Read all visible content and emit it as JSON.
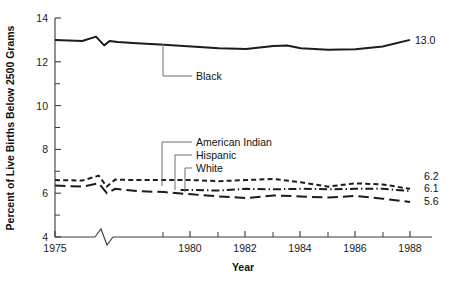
{
  "chart_data": {
    "type": "line",
    "title": "",
    "xlabel": "Year",
    "ylabel": "Percent of Live Births Below 2500 Grams",
    "xlim": [
      1975,
      1988.6
    ],
    "ylim": [
      4,
      14
    ],
    "grid": false,
    "legend": "inline-callout-labels",
    "x_ticks": [
      1975,
      1980,
      1982,
      1984,
      1986,
      1988
    ],
    "x_tick_labels": [
      "1975",
      "1980",
      "1982",
      "1984",
      "1986",
      "1988"
    ],
    "x_minor_ticks": [
      1979,
      1981,
      1983,
      1985,
      1987,
      1988
    ],
    "y_ticks": [
      4,
      6,
      8,
      10,
      12,
      14
    ],
    "y_tick_labels": [
      "4",
      "6",
      "8",
      "10",
      "12",
      "14"
    ],
    "y_minor_ticks": [
      5,
      7,
      9,
      11,
      13
    ],
    "axis_break_x": true,
    "axis_break_note": "zigzag break on x-axis between 1975 and 1979",
    "series": [
      {
        "name": "Black",
        "style": "solid",
        "end_value_label": "13.0",
        "x": [
          1975,
          1976,
          1976.5,
          1976.8,
          1977,
          1977.3,
          1978,
          1979,
          1980,
          1981,
          1982,
          1983,
          1983.5,
          1984,
          1985,
          1986,
          1987,
          1988
        ],
        "values": [
          13.0,
          12.95,
          13.15,
          12.75,
          12.95,
          12.9,
          12.85,
          12.78,
          12.7,
          12.62,
          12.58,
          12.72,
          12.74,
          12.62,
          12.55,
          12.57,
          12.7,
          13.0
        ]
      },
      {
        "name": "American Indian",
        "style": "short-dash",
        "end_value_label": "6.2",
        "x": [
          1975,
          1976,
          1976.6,
          1976.9,
          1977.2,
          1978,
          1979,
          1980,
          1981,
          1982,
          1983,
          1984,
          1985,
          1986,
          1987,
          1988
        ],
        "values": [
          6.6,
          6.58,
          6.8,
          6.3,
          6.62,
          6.6,
          6.6,
          6.6,
          6.55,
          6.6,
          6.65,
          6.5,
          6.3,
          6.45,
          6.4,
          6.2
        ]
      },
      {
        "name": "Hispanic",
        "style": "dash-dot",
        "end_value_label": "6.1",
        "x": [
          1979.6,
          1980,
          1981,
          1982,
          1983,
          1984,
          1985,
          1986,
          1987,
          1988
        ],
        "values": [
          6.15,
          6.15,
          6.12,
          6.2,
          6.18,
          6.2,
          6.18,
          6.2,
          6.2,
          6.1
        ]
      },
      {
        "name": "White",
        "style": "long-dash",
        "end_value_label": "5.6",
        "x": [
          1975,
          1976,
          1976.6,
          1976.9,
          1977.2,
          1978,
          1979,
          1980,
          1981,
          1982,
          1983,
          1984,
          1985,
          1986,
          1987,
          1988
        ],
        "values": [
          6.35,
          6.3,
          6.45,
          6.0,
          6.2,
          6.1,
          6.05,
          5.95,
          5.85,
          5.78,
          5.9,
          5.85,
          5.8,
          5.88,
          5.75,
          5.6
        ]
      }
    ],
    "callouts": [
      {
        "label": "Black",
        "for": "Black"
      },
      {
        "label": "American Indian",
        "for": "American Indian"
      },
      {
        "label": "Hispanic",
        "for": "Hispanic"
      },
      {
        "label": "White",
        "for": "White"
      }
    ],
    "colors": {
      "line": "#1c1c1c",
      "axis": "#3a3a3a",
      "leader": "#6f6f6f",
      "background": "#ffffff"
    }
  }
}
